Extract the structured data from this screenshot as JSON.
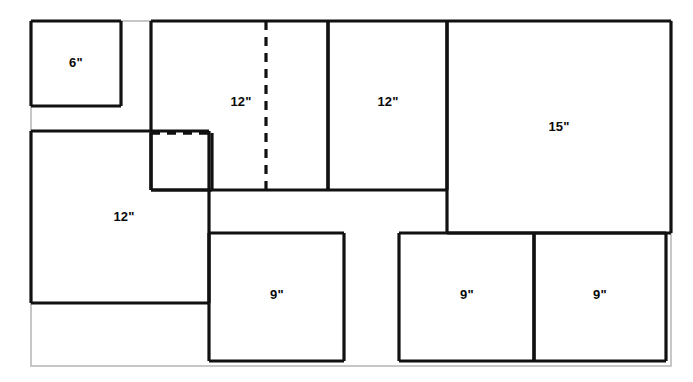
{
  "diagram": {
    "type": "panel-layout-cut-diagram",
    "units": "inches",
    "canvas": {
      "width": 693,
      "height": 382
    },
    "colors": {
      "stroke_solid": "#111111",
      "stroke_faint": "#b9b9b9",
      "background": "#ffffff",
      "text": "#0a0a0a"
    },
    "outer_frame": {
      "name": "sheet-outline",
      "x": 31,
      "y": 21,
      "width": 640,
      "height": 345,
      "stroke": "#b9b9b9",
      "stroke_width": 1.6
    },
    "panels": [
      {
        "id": "panel-6-top-left",
        "label": "6\"",
        "size_in": 6,
        "x": 31,
        "y": 21,
        "width": 90,
        "height": 85,
        "label_x": 76,
        "label_y": 62,
        "edges": {
          "top": "solid",
          "right": "solid",
          "bottom": "solid",
          "left": "solid"
        }
      },
      {
        "id": "panel-12-top-center",
        "label": "12\"",
        "size_in": 12,
        "x": 151,
        "y": 21,
        "width": 177,
        "height": 169,
        "label_x": 241,
        "label_y": 101,
        "edges": {
          "top": "solid",
          "right": "solid",
          "bottom": "solid",
          "left": "solid"
        }
      },
      {
        "id": "panel-12-top-right",
        "label": "12\"",
        "size_in": 12,
        "x": 328,
        "y": 21,
        "width": 119,
        "height": 169,
        "label_x": 388,
        "label_y": 101,
        "edges": {
          "top": "solid",
          "right": "solid",
          "bottom": "solid",
          "left": "solid"
        }
      },
      {
        "id": "panel-15-right",
        "label": "15\"",
        "size_in": 15,
        "x": 447,
        "y": 21,
        "width": 224,
        "height": 212,
        "label_x": 559,
        "label_y": 126,
        "edges": {
          "top": "solid",
          "right": "solid",
          "bottom": "solid",
          "left": "solid"
        }
      },
      {
        "id": "panel-12-left",
        "label": "12\"",
        "size_in": 12,
        "x": 31,
        "y": 131,
        "width": 178,
        "height": 172,
        "label_x": 124,
        "label_y": 216,
        "edges": {
          "top": "solid",
          "right": "solid",
          "bottom": "solid",
          "left": "solid"
        }
      },
      {
        "id": "panel-9-left",
        "label": "9\"",
        "size_in": 9,
        "x": 209,
        "y": 233,
        "width": 135,
        "height": 128,
        "label_x": 277,
        "label_y": 294,
        "edges": {
          "top": "solid",
          "right": "solid",
          "bottom": "solid",
          "left": "solid"
        }
      },
      {
        "id": "panel-9-center",
        "label": "9\"",
        "size_in": 9,
        "x": 399,
        "y": 233,
        "width": 135,
        "height": 128,
        "label_x": 467,
        "label_y": 294,
        "edges": {
          "top": "solid",
          "right": "solid",
          "bottom": "solid",
          "left": "solid"
        }
      },
      {
        "id": "panel-9-right",
        "label": "9\"",
        "size_in": 9,
        "x": 534,
        "y": 233,
        "width": 132,
        "height": 128,
        "label_x": 600,
        "label_y": 294,
        "edges": {
          "top": "solid",
          "right": "solid",
          "bottom": "solid",
          "left": "solid"
        }
      },
      {
        "id": "panel-small-hidden",
        "label": "",
        "size_in": null,
        "x": 151,
        "y": 133,
        "width": 61,
        "height": 57,
        "label_x": null,
        "label_y": null,
        "edges": {
          "top": "dashed",
          "right": "solid",
          "bottom": "solid",
          "left": "solid"
        }
      }
    ],
    "hidden_lines": [
      {
        "id": "dashed-vertical-divider",
        "orientation": "vertical",
        "x1": 266,
        "y1": 21,
        "x2": 266,
        "y2": 190,
        "style": "dashed"
      },
      {
        "id": "dashed-small-box-top",
        "orientation": "horizontal",
        "x1": 151,
        "y1": 133,
        "x2": 212,
        "y2": 133,
        "style": "dashed"
      }
    ],
    "labels": [
      {
        "id": "label-6-top-left",
        "text": "6\"",
        "x": 76,
        "y": 62
      },
      {
        "id": "label-12-top-center",
        "text": "12\"",
        "x": 241,
        "y": 101
      },
      {
        "id": "label-12-top-right",
        "text": "12\"",
        "x": 388,
        "y": 101
      },
      {
        "id": "label-15-right",
        "text": "15\"",
        "x": 559,
        "y": 126
      },
      {
        "id": "label-12-left",
        "text": "12\"",
        "x": 124,
        "y": 216
      },
      {
        "id": "label-9-left",
        "text": "9\"",
        "x": 277,
        "y": 294
      },
      {
        "id": "label-9-center",
        "text": "9\"",
        "x": 467,
        "y": 294
      },
      {
        "id": "label-9-right",
        "text": "9\"",
        "x": 600,
        "y": 294
      }
    ]
  }
}
